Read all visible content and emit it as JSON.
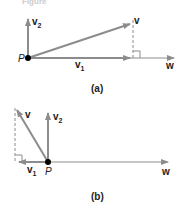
{
  "header": {
    "partial_text": "Figure"
  },
  "colors": {
    "vector": "#8c8c8c",
    "dashed": "#8c8c8c",
    "point": "#000000",
    "text": "#222222"
  },
  "diagram_a": {
    "caption": "(a)",
    "labels": {
      "point": "P",
      "v": "v",
      "v1": "v",
      "v1_sub": "1",
      "v2": "v",
      "v2_sub": "2",
      "w": "w"
    }
  },
  "diagram_b": {
    "caption": "(b)",
    "labels": {
      "point": "P",
      "v": "v",
      "v1": "v",
      "v1_sub": "1",
      "v2": "v",
      "v2_sub": "2",
      "w": "w"
    }
  }
}
